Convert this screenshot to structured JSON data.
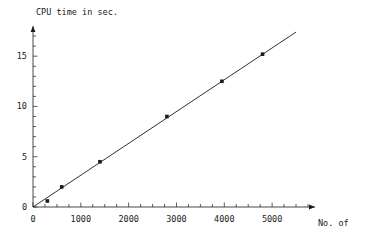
{
  "chart_data": {
    "type": "line",
    "title": "CPU time in sec.",
    "xlabel": "No. of elements",
    "ylabel": "CPU time in sec.",
    "xlim": [
      0,
      5750
    ],
    "ylim": [
      0,
      18
    ],
    "grid": false,
    "legend": null,
    "x_ticks": [
      0,
      1000,
      2000,
      3000,
      4000,
      5000
    ],
    "x_tick_labels": [
      "0",
      "1000",
      "2000",
      "3000",
      "4000",
      "5000"
    ],
    "x_minor_tick_step": 250,
    "y_ticks": [
      0,
      5,
      10,
      15
    ],
    "y_tick_labels": [
      "0",
      "5",
      "10",
      "15"
    ],
    "y_minor_tick_step": 1,
    "series": [
      {
        "name": "CPU time",
        "marker": "filled-square",
        "line": "solid",
        "color": "#1a1a1a",
        "x": [
          300,
          600,
          1400,
          2800,
          3950,
          4800
        ],
        "y": [
          0.6,
          2.0,
          4.5,
          9.0,
          12.5,
          15.2
        ]
      }
    ],
    "trend_line": {
      "x_start": 0,
      "y_start": 0,
      "x_end": 5500,
      "y_end": 17.4
    }
  },
  "axes": {
    "x_title_line1": "No. of",
    "x_title_line2": "elements",
    "y_title": "CPU time in sec."
  }
}
